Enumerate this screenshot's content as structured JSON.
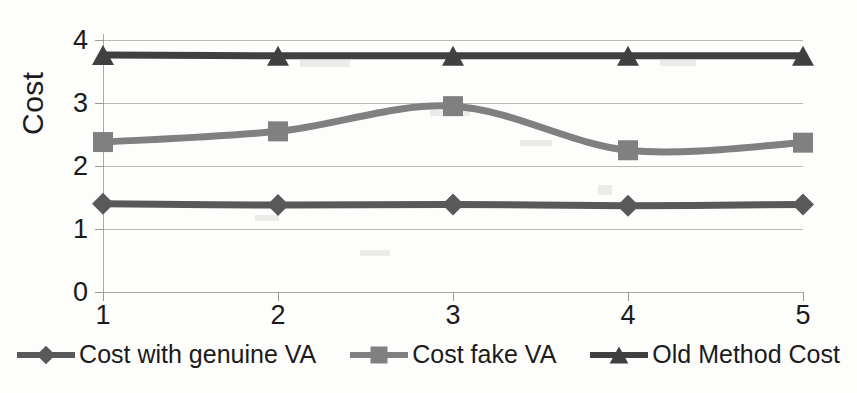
{
  "chart_data": {
    "type": "line",
    "title": "",
    "subtitle": "",
    "xlabel": "",
    "ylabel": "Cost",
    "x": [
      1,
      2,
      3,
      4,
      5
    ],
    "xtick_labels": [
      "1",
      "2",
      "3",
      "4",
      "5"
    ],
    "ytick_labels": [
      "0",
      "1",
      "2",
      "3",
      "4"
    ],
    "yticks": [
      0,
      1,
      2,
      3,
      4
    ],
    "ylim": [
      0,
      4
    ],
    "xlim": [
      1,
      5
    ],
    "grid": true,
    "legend_position": "bottom",
    "smooth": true,
    "series": [
      {
        "name": "Cost with genuine VA",
        "marker": "diamond",
        "color": "#595959",
        "values": [
          1.4,
          1.38,
          1.39,
          1.37,
          1.39
        ]
      },
      {
        "name": "Cost fake VA",
        "marker": "square",
        "color": "#808080",
        "values": [
          2.38,
          2.55,
          2.95,
          2.25,
          2.37
        ]
      },
      {
        "name": "Old Method Cost",
        "marker": "triangle",
        "color": "#404040",
        "values": [
          3.76,
          3.75,
          3.75,
          3.75,
          3.75
        ]
      }
    ]
  },
  "axis": {
    "y_title": "Cost"
  },
  "legend": {
    "items": [
      {
        "label": "Cost with genuine VA",
        "marker": "diamond-marker-icon",
        "color": "#595959"
      },
      {
        "label": "Cost fake VA",
        "marker": "square-marker-icon",
        "color": "#808080"
      },
      {
        "label": "Old Method Cost",
        "marker": "triangle-marker-icon",
        "color": "#404040"
      }
    ]
  },
  "colors": {
    "grid": "#b9b9b6",
    "axis": "#a9a9a6",
    "text": "#1b1b1b",
    "background": "#fdfdfc"
  }
}
